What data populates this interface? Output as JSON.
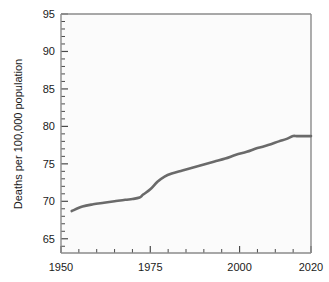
{
  "chart_data": {
    "type": "line",
    "title": "",
    "subtitle": "",
    "xlabel": "",
    "ylabel": "Deaths per 100,000 population",
    "xlim": [
      1950,
      2020
    ],
    "ylim": [
      63.1,
      95
    ],
    "grid": false,
    "legend": null,
    "x_ticks_major": [
      1950,
      1975,
      2000,
      2020
    ],
    "x_tick_labels": [
      "1950",
      "1975",
      "2000",
      "2020"
    ],
    "x_ticks_minor_step": 5,
    "y_ticks_major": [
      65,
      70,
      75,
      80,
      85,
      90,
      95
    ],
    "y_tick_labels": [
      "65",
      "70",
      "75",
      "80",
      "85",
      "90",
      "95"
    ],
    "y_ticks_minor_step": 1,
    "line_color": "#6a6a6a",
    "line_width": 2.6,
    "axis_color": "#8c8c8c",
    "background_color": "#ffffff",
    "plot_background_color": "#fbfbfb",
    "series": [
      {
        "name": "Deaths per 100,000 population",
        "x": [
          1953,
          1956,
          1959,
          1962,
          1965,
          1968,
          1970,
          1972,
          1973,
          1975,
          1977,
          1979,
          1981,
          1984,
          1987,
          1990,
          1993,
          1996,
          1999,
          2002,
          2005,
          2008,
          2011,
          2013,
          2015,
          2016,
          2018,
          2020
        ],
        "values": [
          68.7,
          69.3,
          69.6,
          69.8,
          70.0,
          70.2,
          70.3,
          70.5,
          70.9,
          71.6,
          72.6,
          73.3,
          73.7,
          74.1,
          74.5,
          74.9,
          75.3,
          75.7,
          76.2,
          76.6,
          77.1,
          77.5,
          78.0,
          78.3,
          78.7,
          78.7,
          78.7,
          78.7
        ]
      }
    ]
  }
}
